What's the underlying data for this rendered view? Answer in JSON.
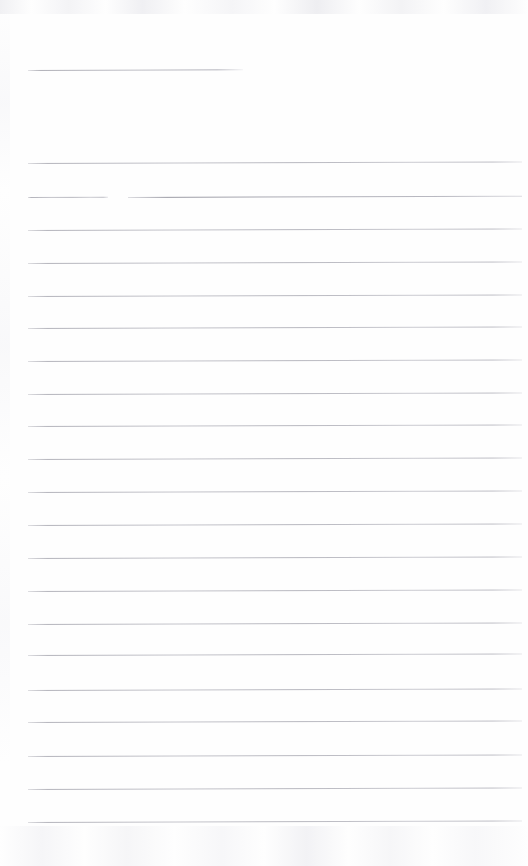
{
  "document": {
    "kind": "scanned-ruled-notebook-page",
    "page_width": 528,
    "page_height": 866,
    "paper_color": "#fefefe",
    "rule_color": "#b4b4bc",
    "body_text": "",
    "handwriting": "",
    "notes": "Blank scanned lined paper. No text, headings, numbers or handwriting are visible anywhere on the page."
  },
  "layout": {
    "left_margin_x": 28,
    "right_edge_x": 522,
    "line_spacing_px": 33,
    "header_rule_label": "header-rule",
    "body_rule_label": "ruled-line"
  },
  "rules": [
    {
      "id": "header-rule",
      "y": 70,
      "x1": 28,
      "x2": 243,
      "weight": 1.0,
      "broken": false
    },
    {
      "id": "rule-01",
      "y": 163,
      "x1": 28,
      "x2": 522,
      "weight": 1.0,
      "broken": false
    },
    {
      "id": "rule-02",
      "y": 197,
      "x1": 28,
      "x2": 522,
      "weight": 1.3,
      "broken": true,
      "gap_x1": 108,
      "gap_x2": 128
    },
    {
      "id": "rule-03",
      "y": 230,
      "x1": 28,
      "x2": 522,
      "weight": 1.0,
      "broken": false
    },
    {
      "id": "rule-04",
      "y": 263,
      "x1": 28,
      "x2": 522,
      "weight": 1.0,
      "broken": false
    },
    {
      "id": "rule-05",
      "y": 296,
      "x1": 28,
      "x2": 522,
      "weight": 1.0,
      "broken": false
    },
    {
      "id": "rule-06",
      "y": 328,
      "x1": 28,
      "x2": 522,
      "weight": 1.0,
      "broken": false
    },
    {
      "id": "rule-07",
      "y": 361,
      "x1": 28,
      "x2": 522,
      "weight": 1.0,
      "broken": false
    },
    {
      "id": "rule-08",
      "y": 394,
      "x1": 28,
      "x2": 522,
      "weight": 1.0,
      "broken": false
    },
    {
      "id": "rule-09",
      "y": 426,
      "x1": 28,
      "x2": 522,
      "weight": 1.0,
      "broken": false
    },
    {
      "id": "rule-10",
      "y": 459,
      "x1": 28,
      "x2": 522,
      "weight": 1.0,
      "broken": false
    },
    {
      "id": "rule-11",
      "y": 492,
      "x1": 28,
      "x2": 522,
      "weight": 1.0,
      "broken": false
    },
    {
      "id": "rule-12",
      "y": 525,
      "x1": 28,
      "x2": 522,
      "weight": 1.0,
      "broken": false
    },
    {
      "id": "rule-13",
      "y": 558,
      "x1": 28,
      "x2": 522,
      "weight": 1.0,
      "broken": false
    },
    {
      "id": "rule-14",
      "y": 591,
      "x1": 28,
      "x2": 522,
      "weight": 1.0,
      "broken": false
    },
    {
      "id": "rule-15",
      "y": 624,
      "x1": 28,
      "x2": 522,
      "weight": 1.0,
      "broken": false
    },
    {
      "id": "rule-16",
      "y": 655,
      "x1": 28,
      "x2": 522,
      "weight": 1.0,
      "broken": false
    },
    {
      "id": "rule-17",
      "y": 690,
      "x1": 28,
      "x2": 522,
      "weight": 1.0,
      "broken": false
    },
    {
      "id": "rule-18",
      "y": 722,
      "x1": 28,
      "x2": 522,
      "weight": 1.0,
      "broken": false
    },
    {
      "id": "rule-19",
      "y": 756,
      "x1": 28,
      "x2": 522,
      "weight": 1.0,
      "broken": false
    },
    {
      "id": "rule-20",
      "y": 789,
      "x1": 28,
      "x2": 522,
      "weight": 1.0,
      "broken": false
    },
    {
      "id": "rule-21",
      "y": 822,
      "x1": 28,
      "x2": 522,
      "weight": 1.0,
      "broken": false
    }
  ]
}
